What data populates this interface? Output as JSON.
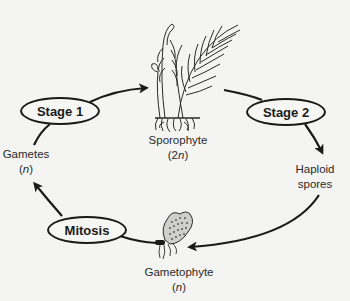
{
  "diagram": {
    "stages": {
      "stage1": "Stage 1",
      "stage2": "Stage 2",
      "mitosis": "Mitosis"
    },
    "nodes": {
      "sporophyte": {
        "name": "Sporophyte",
        "ploidy_prefix": "(2",
        "ploidy_var": "n",
        "ploidy_suffix": ")"
      },
      "haploid_spores": {
        "line1": "Haploid",
        "line2": "spores"
      },
      "gametophyte": {
        "name": "Gametophyte",
        "ploidy_prefix": "(",
        "ploidy_var": "n",
        "ploidy_suffix": ")"
      },
      "gametes": {
        "name": "Gametes",
        "ploidy_prefix": "(",
        "ploidy_var": "n",
        "ploidy_suffix": ")"
      }
    },
    "cycle_order": [
      "Gametes (n)",
      "Stage 1",
      "Sporophyte (2n)",
      "Stage 2",
      "Haploid spores",
      "Gametophyte (n)",
      "Mitosis"
    ],
    "colors": {
      "background": "#f4f4f2",
      "ink": "#1a1a1a"
    }
  }
}
